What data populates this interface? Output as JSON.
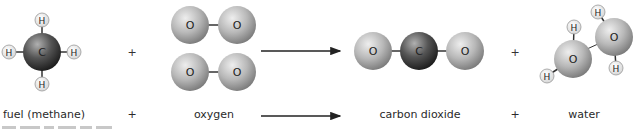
{
  "diagram": {
    "colors": {
      "oxygen_atom": "#b5b5b5",
      "carbon_atom": "#4a4a4a",
      "hydrogen_atom": "#f2f2f2",
      "bond": "#333333",
      "arrow": "#222222",
      "text": "#2a2a2a"
    },
    "atom_letters": {
      "carbon": "C",
      "oxygen": "O",
      "hydrogen": "H"
    },
    "operators": {
      "plus": "+",
      "arrow": "→"
    },
    "labels": {
      "methane": "fuel (methane)",
      "plus1": "+",
      "oxygen": "oxygen",
      "carbon_dioxide": "carbon dioxide",
      "plus2": "+",
      "water": "water"
    }
  }
}
